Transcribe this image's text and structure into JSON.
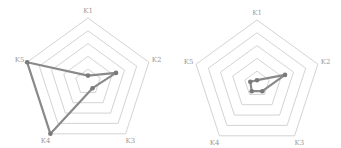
{
  "chart_data": [
    {
      "type": "radar",
      "title": "",
      "axes": [
        "K1",
        "K2",
        "K3",
        "K4",
        "K5"
      ],
      "rings": 5,
      "range": [
        0,
        5
      ],
      "grid": true,
      "series": [
        {
          "name": "",
          "values": [
            0.5,
            2.3,
            0.6,
            5,
            5
          ]
        }
      ],
      "center": [
        88,
        82
      ],
      "radius": 64
    },
    {
      "type": "radar",
      "title": "",
      "axes": [
        "K1",
        "K2",
        "K3",
        "K4",
        "K5"
      ],
      "rings": 5,
      "range": [
        0,
        5
      ],
      "grid": true,
      "series": [
        {
          "name": "",
          "values": [
            0.3,
            2.3,
            0.7,
            0.7,
            0.55
          ]
        }
      ],
      "center": [
        257,
        84
      ],
      "radius": 64
    }
  ],
  "colors": {
    "grid": "#c8c8c8",
    "series": "#8a8a8a",
    "point": "#7a7a7a",
    "label": "#9a9a9a"
  }
}
